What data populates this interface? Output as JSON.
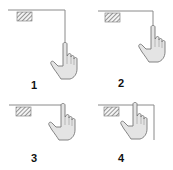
{
  "diagram": {
    "type": "gesture-steps",
    "colors": {
      "line": "#8a8a8a",
      "hatch": "#6a6a6a",
      "hand_fill": "#e4e4e4",
      "hand_stroke": "#777777",
      "label": "#111111"
    },
    "steps": [
      {
        "label": "1",
        "description": "finger at bottom of vertical edge line",
        "icon": "hand-pointer-icon"
      },
      {
        "label": "2",
        "description": "finger moved up along vertical edge line",
        "icon": "hand-pointer-icon"
      },
      {
        "label": "3",
        "description": "finger at top edge, vertical line gone",
        "icon": "hand-pointer-icon"
      },
      {
        "label": "4",
        "description": "finger inside corner, line extends down right",
        "icon": "hand-pointer-icon"
      }
    ]
  }
}
